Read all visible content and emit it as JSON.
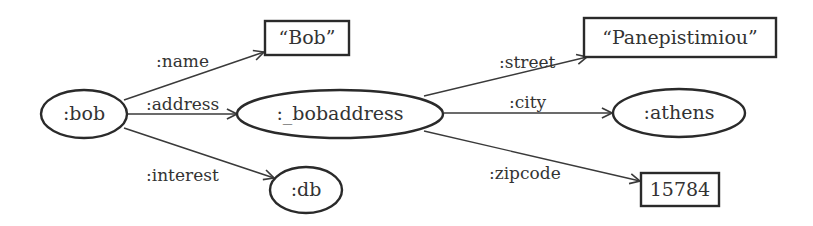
{
  "diagram": {
    "type": "rdf-graph",
    "nodes": [
      {
        "id": "bob",
        "label": ":bob",
        "shape": "ellipse"
      },
      {
        "id": "bob_literal",
        "label": "“Bob”",
        "shape": "rect"
      },
      {
        "id": "bobaddress",
        "label": ":_bobaddress",
        "shape": "ellipse"
      },
      {
        "id": "db",
        "label": ":db",
        "shape": "ellipse"
      },
      {
        "id": "street_literal",
        "label": "“Panepistimiou”",
        "shape": "rect"
      },
      {
        "id": "athens",
        "label": ":athens",
        "shape": "ellipse"
      },
      {
        "id": "zip_literal",
        "label": "15784",
        "shape": "rect"
      }
    ],
    "edges": [
      {
        "from": "bob",
        "to": "bob_literal",
        "label": ":name"
      },
      {
        "from": "bob",
        "to": "bobaddress",
        "label": ":address"
      },
      {
        "from": "bob",
        "to": "db",
        "label": ":interest"
      },
      {
        "from": "bobaddress",
        "to": "street_literal",
        "label": ":street"
      },
      {
        "from": "bobaddress",
        "to": "athens",
        "label": ":city"
      },
      {
        "from": "bobaddress",
        "to": "zip_literal",
        "label": ":zipcode"
      }
    ]
  }
}
